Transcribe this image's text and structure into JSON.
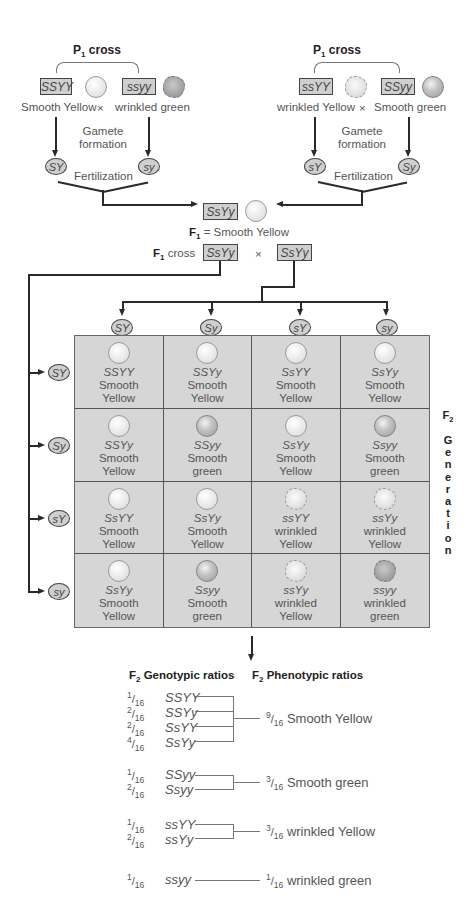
{
  "left_p1_cross": {
    "title": "P",
    "title_sub": "1",
    "title_suffix": " cross",
    "parent1": {
      "genotype": "SSYY",
      "seed": "smooth-yellow",
      "label": "Smooth Yellow"
    },
    "parent2": {
      "genotype": "ssyy",
      "seed": "wrinkled-green",
      "label": "wrinkled green"
    },
    "cross_symbol": "×",
    "gamete_formation": [
      "Gamete",
      "formation"
    ],
    "gamete1": "SY",
    "gamete2": "sy",
    "fertilization": "Fertilization"
  },
  "right_p1_cross": {
    "title": "P",
    "title_sub": "1",
    "title_suffix": " cross",
    "parent1": {
      "genotype": "ssYY",
      "seed": "wrinkled-yellow",
      "label": "wrinkled Yellow"
    },
    "parent2": {
      "genotype": "SSyy",
      "seed": "smooth-green",
      "label": "Smooth green"
    },
    "cross_symbol": "×",
    "gamete_formation": [
      "Gamete",
      "formation"
    ],
    "gamete1": "sY",
    "gamete2": "Sy",
    "fertilization": "Fertilization"
  },
  "f1": {
    "genotype": "SsYy",
    "label_prefix": "F",
    "label_sub": "1",
    "label_text": " = Smooth Yellow",
    "cross_label_prefix": "F",
    "cross_label_sub": "1",
    "cross_label_text": " cross",
    "cross_parent1": "SsYy",
    "cross_symbol": "×",
    "cross_parent2": "SsYy"
  },
  "punnett": {
    "column_gametes": [
      "SY",
      "Sy",
      "sY",
      "sy"
    ],
    "row_gametes": [
      "SY",
      "Sy",
      "sY",
      "sy"
    ],
    "side_label": {
      "prefix": "F",
      "sub": "2",
      "letters": [
        "G",
        "e",
        "n",
        "e",
        "r",
        "a",
        "t",
        "i",
        "o",
        "n"
      ]
    },
    "cells": [
      [
        {
          "genotype": "SSYY",
          "line1": "Smooth",
          "line2": "Yellow",
          "seed": "smooth-yellow"
        },
        {
          "genotype": "SSYy",
          "line1": "Smooth",
          "line2": "Yellow",
          "seed": "smooth-yellow"
        },
        {
          "genotype": "SsYY",
          "line1": "Smooth",
          "line2": "Yellow",
          "seed": "smooth-yellow"
        },
        {
          "genotype": "SsYy",
          "line1": "Smooth",
          "line2": "Yellow",
          "seed": "smooth-yellow"
        }
      ],
      [
        {
          "genotype": "SSYy",
          "line1": "Smooth",
          "line2": "Yellow",
          "seed": "smooth-yellow"
        },
        {
          "genotype": "SSyy",
          "line1": "Smooth",
          "line2": "green",
          "seed": "smooth-green"
        },
        {
          "genotype": "SsYy",
          "line1": "Smooth",
          "line2": "Yellow",
          "seed": "smooth-yellow"
        },
        {
          "genotype": "Ssyy",
          "line1": "Smooth",
          "line2": "green",
          "seed": "smooth-green"
        }
      ],
      [
        {
          "genotype": "SsYY",
          "line1": "Smooth",
          "line2": "Yellow",
          "seed": "smooth-yellow"
        },
        {
          "genotype": "SsYy",
          "line1": "Smooth",
          "line2": "Yellow",
          "seed": "smooth-yellow"
        },
        {
          "genotype": "ssYY",
          "line1": "wrinkled",
          "line2": "Yellow",
          "seed": "wrinkled-yellow"
        },
        {
          "genotype": "ssYy",
          "line1": "wrinkled",
          "line2": "Yellow",
          "seed": "wrinkled-yellow"
        }
      ],
      [
        {
          "genotype": "SsYy",
          "line1": "Smooth",
          "line2": "Yellow",
          "seed": "smooth-yellow"
        },
        {
          "genotype": "Ssyy",
          "line1": "Smooth",
          "line2": "green",
          "seed": "smooth-green"
        },
        {
          "genotype": "ssYy",
          "line1": "wrinkled",
          "line2": "Yellow",
          "seed": "wrinkled-yellow"
        },
        {
          "genotype": "ssyy",
          "line1": "wrinkled",
          "line2": "green",
          "seed": "wrinkled-green"
        }
      ]
    ]
  },
  "ratios": {
    "genotypic_header": {
      "prefix": "F",
      "sub": "2",
      "text": " Genotypic ratios"
    },
    "phenotypic_header": {
      "prefix": "F",
      "sub": "2",
      "text": " Phenotypic ratios"
    },
    "groups": [
      {
        "genotypes": [
          {
            "num": "1",
            "den": "16",
            "genotype": "SSYY"
          },
          {
            "num": "2",
            "den": "16",
            "genotype": "SSYy"
          },
          {
            "num": "2",
            "den": "16",
            "genotype": "SsYY"
          },
          {
            "num": "4",
            "den": "16",
            "genotype": "SsYy"
          }
        ],
        "phenotype": {
          "num": "9",
          "den": "16",
          "label": "Smooth Yellow"
        }
      },
      {
        "genotypes": [
          {
            "num": "1",
            "den": "16",
            "genotype": "SSyy"
          },
          {
            "num": "2",
            "den": "16",
            "genotype": "Ssyy"
          }
        ],
        "phenotype": {
          "num": "3",
          "den": "16",
          "label": "Smooth green"
        }
      },
      {
        "genotypes": [
          {
            "num": "1",
            "den": "16",
            "genotype": "ssYY"
          },
          {
            "num": "2",
            "den": "16",
            "genotype": "ssYy"
          }
        ],
        "phenotype": {
          "num": "3",
          "den": "16",
          "label": "wrinkled Yellow"
        }
      },
      {
        "genotypes": [
          {
            "num": "1",
            "den": "16",
            "genotype": "ssyy"
          }
        ],
        "phenotype": {
          "num": "1",
          "den": "16",
          "label": "wrinkled green"
        }
      }
    ]
  },
  "colors": {
    "box_fill": "#cfcfcf",
    "grid_fill": "#d6d6d6",
    "line": "#2a2a2a",
    "text": "#555555",
    "heading": "#222222"
  }
}
